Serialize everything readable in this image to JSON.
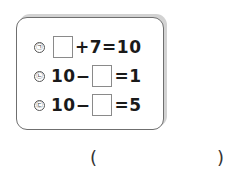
{
  "problem": {
    "equations": [
      {
        "label": "㉠",
        "parts": [
          "",
          "+7=10"
        ],
        "blank_position": 0,
        "lead": "",
        "tail": "+7=10"
      },
      {
        "label": "㉡",
        "lead": "10−",
        "tail": "=1",
        "blank_position": 1
      },
      {
        "label": "㉢",
        "lead": "10−",
        "tail": "=5",
        "blank_position": 1
      }
    ]
  },
  "answer": {
    "open_paren": "(",
    "close_paren": ")",
    "value": ""
  }
}
